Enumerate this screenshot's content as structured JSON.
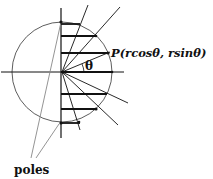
{
  "diagram": {
    "point_label": "P(rcosθ, rsinθ)",
    "angle_label": "θ",
    "poles_label": "poles",
    "colors": {
      "ink": "#111111",
      "pole_line": "#888888",
      "background": "#ffffff"
    }
  }
}
